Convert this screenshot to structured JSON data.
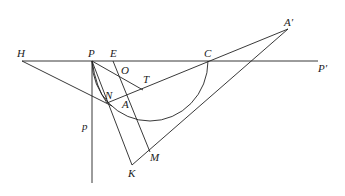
{
  "diagram": {
    "type": "geometry",
    "labels": {
      "H": "H",
      "P": "P",
      "E": "E",
      "C": "C",
      "A_prime": "A′",
      "P_prime": "P′",
      "O": "O",
      "T": "T",
      "N": "N",
      "A": "A",
      "p": "p",
      "M": "M",
      "K": "K"
    },
    "points": {
      "H": [
        22,
        61
      ],
      "P": [
        92,
        61
      ],
      "E": [
        113,
        61
      ],
      "C": [
        208,
        61
      ],
      "P_prime": [
        318,
        61
      ],
      "A_prime": [
        288,
        29
      ],
      "O": [
        121,
        79
      ],
      "T": [
        143,
        90
      ],
      "N": [
        107,
        103
      ],
      "A": [
        124,
        97
      ],
      "M": [
        150,
        152
      ],
      "K": [
        132,
        165
      ],
      "p_bottom": [
        92,
        183
      ]
    },
    "stroke_color": "#222222",
    "background": "#ffffff"
  }
}
